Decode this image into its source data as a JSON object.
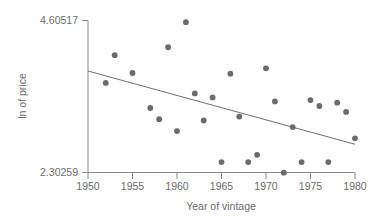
{
  "chart_data": {
    "type": "scatter",
    "title": "",
    "xlabel": "Year of vintage",
    "ylabel": "ln of price",
    "xlim": [
      1950,
      1980
    ],
    "ylim": [
      2.30259,
      4.60517
    ],
    "xticks": [
      1950,
      1955,
      1960,
      1965,
      1970,
      1975,
      1980
    ],
    "xtick_labels": [
      "1950",
      "1955",
      "1960",
      "1965",
      "1970",
      "1975",
      "1980"
    ],
    "yticks": [
      2.30259,
      4.60517
    ],
    "ytick_labels": [
      "2.30259",
      "4.60517"
    ],
    "grid": false,
    "legend": null,
    "point_color": "#6b6b6b",
    "line_color": "#6e6e6e",
    "axis_color": "#8a8a8a",
    "text_color": "#6b6b6b",
    "x": [
      1952,
      1953,
      1955,
      1957,
      1958,
      1959,
      1960,
      1961,
      1962,
      1963,
      1964,
      1965,
      1966,
      1967,
      1968,
      1969,
      1970,
      1971,
      1972,
      1973,
      1974,
      1975,
      1976,
      1977,
      1978,
      1979,
      1980
    ],
    "values": [
      3.66,
      4.08,
      3.81,
      3.28,
      3.11,
      4.2,
      2.93,
      4.58,
      3.5,
      3.09,
      3.44,
      2.46,
      3.8,
      3.15,
      2.46,
      2.57,
      3.88,
      3.38,
      2.3,
      2.99,
      2.46,
      3.4,
      3.31,
      2.46,
      3.36,
      3.22,
      2.82
    ],
    "trend_line": {
      "x_start": 1950,
      "y_start": 3.84,
      "x_end": 1980,
      "y_end": 2.73,
      "slope": -0.037
    }
  },
  "axis": {
    "y_top_label": "4.60517",
    "y_bottom_label": "2.30259",
    "y_title": "ln of price",
    "x_title": "Year of vintage"
  }
}
